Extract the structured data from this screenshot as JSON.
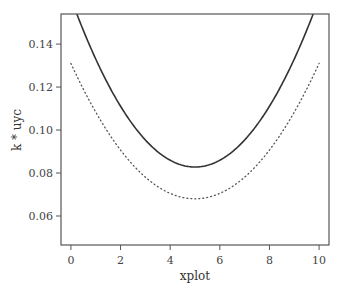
{
  "chart_data": {
    "type": "line",
    "title": "",
    "xlabel": "xplot",
    "ylabel": "k * uyc",
    "xlim": [
      -0.4,
      10.4
    ],
    "ylim": [
      0.0465,
      0.154
    ],
    "xticks": [
      0,
      2,
      4,
      6,
      8,
      10
    ],
    "xtick_labels": [
      "0",
      "2",
      "4",
      "6",
      "8",
      "10"
    ],
    "yticks": [
      0.06,
      0.08,
      0.1,
      0.12,
      0.14
    ],
    "ytick_labels": [
      "0.06",
      "0.08",
      "0.10",
      "0.12",
      "0.14"
    ],
    "grid": false,
    "legend": null,
    "x": [
      0,
      0.5,
      1,
      1.5,
      2,
      2.5,
      3,
      3.5,
      4,
      4.5,
      5,
      5.5,
      6,
      6.5,
      7,
      7.5,
      8,
      8.5,
      9,
      9.5,
      10
    ],
    "series": [
      {
        "name": "solid",
        "style": "solid",
        "color": "#333333",
        "values": [
          0.1613,
          0.1464,
          0.133,
          0.1213,
          0.1111,
          0.1024,
          0.0954,
          0.09,
          0.0861,
          0.0838,
          0.0828,
          0.0838,
          0.0861,
          0.09,
          0.0954,
          0.1024,
          0.1111,
          0.1213,
          0.133,
          0.1464,
          0.1613
        ]
      },
      {
        "name": "dotted",
        "style": "dotted",
        "color": "#555555",
        "values": [
          0.131,
          0.119,
          0.1083,
          0.0988,
          0.0907,
          0.0838,
          0.0781,
          0.0738,
          0.0705,
          0.0686,
          0.068,
          0.0686,
          0.0705,
          0.0738,
          0.0781,
          0.0838,
          0.0907,
          0.0988,
          0.1083,
          0.119,
          0.131
        ]
      }
    ]
  }
}
